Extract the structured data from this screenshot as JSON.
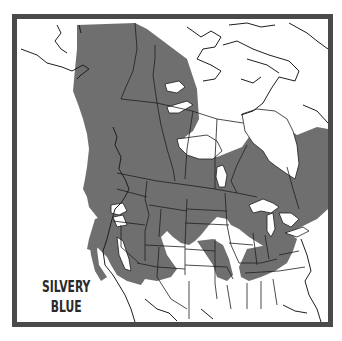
{
  "map": {
    "title_line1": "SILVERY",
    "title_line2": "BLUE",
    "species": "Silvery Blue",
    "region": "North America",
    "colors": {
      "range_fill": "#6f6f6f",
      "frame_border": "#4a4a4a",
      "outline": "#1e1e1e",
      "background": "#ffffff"
    }
  }
}
